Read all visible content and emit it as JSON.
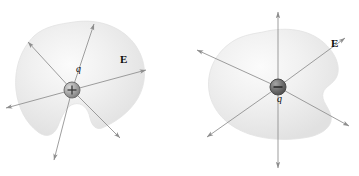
{
  "figure": {
    "background_color": "#ffffff",
    "width": 359,
    "height": 176,
    "panels": [
      {
        "id": "left",
        "charge": {
          "symbol": "+",
          "sign": "positive",
          "label": "q",
          "label_position": "above-right",
          "sphere_fill": "#9c9c9c",
          "sphere_stroke": "#6e6e6e",
          "center_x": 72,
          "center_y": 90,
          "radius": 8
        },
        "field_label": {
          "text": "E",
          "bold": true,
          "color": "#0b0b0b",
          "x": 124,
          "y": 60
        },
        "surface": {
          "name": "closed-gaussian-surface",
          "fill_light": "#f3f3f3",
          "fill_mid": "#e6e6e6",
          "edge_color": "#dcdcdc",
          "shape": "irregular-blob-with-bottom-notch"
        },
        "field_lines": {
          "count": 4,
          "ray_count": 8,
          "direction": "outward",
          "color": "#8d8d8d",
          "arrowheads": "outer-ends",
          "angles_deg": [
            12,
            58,
            130,
            255
          ]
        }
      },
      {
        "id": "right",
        "charge": {
          "symbol": "−",
          "sign": "negative",
          "label": "q",
          "label_position": "below",
          "sphere_fill": "#6b6b6b",
          "sphere_stroke": "#4a4a4a",
          "center_x": 99,
          "center_y": 87,
          "radius": 8
        },
        "field_label": {
          "text": "E",
          "bold": true,
          "color": "#0b0b0b",
          "x": 158,
          "y": 44
        },
        "surface": {
          "name": "closed-gaussian-surface",
          "fill_light": "#f3f3f3",
          "fill_mid": "#e7e7e7",
          "edge_color": "#dcdcdc",
          "shape": "irregular-blob-with-right-notch"
        },
        "field_lines": {
          "count": 3,
          "ray_count": 6,
          "direction": "outward",
          "color": "#8d8d8d",
          "arrowheads": "outer-ends",
          "angles_deg": [
            32,
            90,
            150
          ]
        }
      }
    ],
    "colors": {
      "line": "#8d8d8d",
      "text": "#0b0b0b",
      "blob_fill": "#ececec",
      "positive_charge": "#9c9c9c",
      "negative_charge": "#6b6b6b"
    }
  }
}
